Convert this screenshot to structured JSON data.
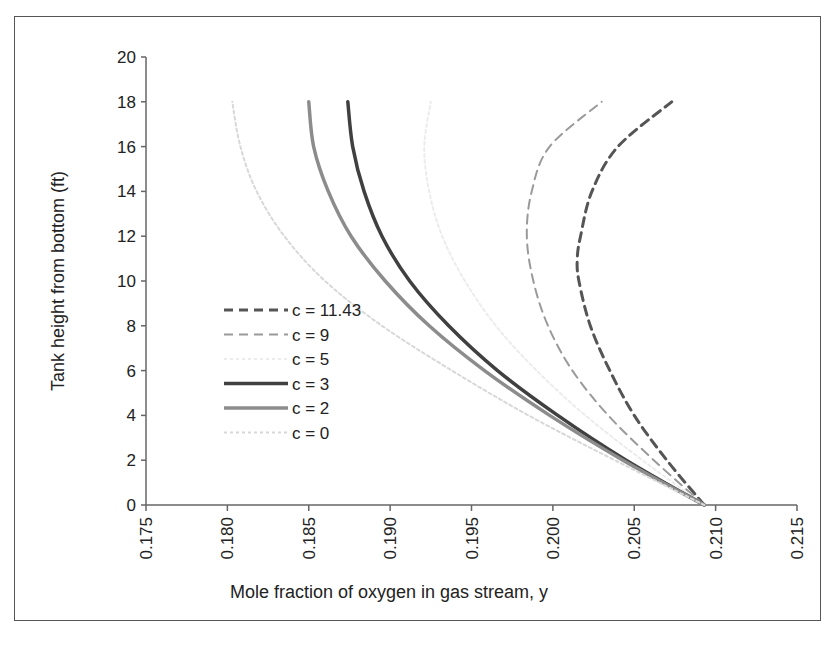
{
  "chart_data": {
    "type": "line",
    "title": "",
    "xlabel": "Mole fraction of oxygen in gas stream, y",
    "ylabel": "Tank height from bottom (ft)",
    "xlim": [
      0.175,
      0.215
    ],
    "ylim": [
      0,
      20
    ],
    "xticks": [
      "0.175",
      "0.180",
      "0.185",
      "0.190",
      "0.195",
      "0.200",
      "0.205",
      "0.210",
      "0.215"
    ],
    "yticks": [
      "0",
      "2",
      "4",
      "6",
      "8",
      "10",
      "12",
      "14",
      "16",
      "18",
      "20"
    ],
    "grid": false,
    "legend_position": "center-left",
    "series": [
      {
        "name": "c = 11.43",
        "style": "dashed",
        "color": "#555555",
        "width": 3,
        "points": [
          [
            0.2093,
            0
          ],
          [
            0.207,
            2
          ],
          [
            0.205,
            4
          ],
          [
            0.2035,
            6
          ],
          [
            0.2023,
            8
          ],
          [
            0.2016,
            10
          ],
          [
            0.2015,
            11
          ],
          [
            0.2017,
            12
          ],
          [
            0.2024,
            14
          ],
          [
            0.204,
            16
          ],
          [
            0.2073,
            18
          ]
        ]
      },
      {
        "name": "c = 9",
        "style": "dashed",
        "color": "#9a9a9a",
        "width": 2,
        "points": [
          [
            0.2093,
            0
          ],
          [
            0.2062,
            2
          ],
          [
            0.2034,
            4
          ],
          [
            0.2012,
            6
          ],
          [
            0.1997,
            8
          ],
          [
            0.1988,
            10
          ],
          [
            0.1984,
            12
          ],
          [
            0.1987,
            14
          ],
          [
            0.1998,
            16
          ],
          [
            0.203,
            18
          ]
        ]
      },
      {
        "name": "c = 5",
        "style": "dotted",
        "color": "#ececec",
        "width": 2,
        "points": [
          [
            0.2093,
            0
          ],
          [
            0.2055,
            2
          ],
          [
            0.202,
            4
          ],
          [
            0.199,
            6
          ],
          [
            0.1965,
            8
          ],
          [
            0.1946,
            10
          ],
          [
            0.1932,
            12
          ],
          [
            0.1924,
            14
          ],
          [
            0.1921,
            16
          ],
          [
            0.1925,
            18
          ]
        ]
      },
      {
        "name": "c = 3",
        "style": "solid",
        "color": "#404040",
        "width": 3.5,
        "points": [
          [
            0.2093,
            0
          ],
          [
            0.2045,
            2
          ],
          [
            0.2003,
            4
          ],
          [
            0.1966,
            6
          ],
          [
            0.1936,
            8
          ],
          [
            0.1912,
            10
          ],
          [
            0.1895,
            12
          ],
          [
            0.1884,
            14
          ],
          [
            0.1877,
            16
          ],
          [
            0.1874,
            18
          ]
        ]
      },
      {
        "name": "c = 2",
        "style": "solid",
        "color": "#8c8c8c",
        "width": 3.5,
        "points": [
          [
            0.2093,
            0
          ],
          [
            0.2043,
            2
          ],
          [
            0.1998,
            4
          ],
          [
            0.1958,
            6
          ],
          [
            0.1924,
            8
          ],
          [
            0.1897,
            10
          ],
          [
            0.1876,
            12
          ],
          [
            0.1862,
            14
          ],
          [
            0.1853,
            16
          ],
          [
            0.185,
            18
          ]
        ]
      },
      {
        "name": "c = 0",
        "style": "dotted",
        "color": "#d8d8d8",
        "width": 2,
        "points": [
          [
            0.2093,
            0
          ],
          [
            0.2038,
            2
          ],
          [
            0.1985,
            4
          ],
          [
            0.1938,
            6
          ],
          [
            0.1895,
            8
          ],
          [
            0.186,
            10
          ],
          [
            0.1835,
            12
          ],
          [
            0.1818,
            14
          ],
          [
            0.1808,
            16
          ],
          [
            0.1803,
            18
          ]
        ]
      }
    ]
  }
}
